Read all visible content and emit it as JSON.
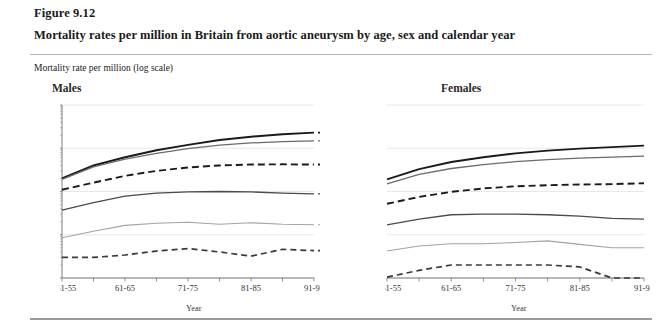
{
  "figure": {
    "label": "Figure 9.12",
    "title": "Mortality rates per million in Britain from aortic aneurysm by age, sex and calendar year",
    "axis_caption": "Mortality rate per million (log scale)"
  },
  "chart_data": {
    "type": "line",
    "title": "Mortality rates per million in Britain from aortic aneurysm by age, sex and calendar year",
    "subtitle": "Mortality rate per million (log scale)",
    "xlabel": "Year",
    "ylabel": "Mortality rate per million (log scale)",
    "yscale": "log",
    "ylim": [
      1,
      10000
    ],
    "ytick_labels": [
      "1",
      "10",
      "100",
      "1,000",
      "10,000"
    ],
    "ytick_values": [
      1,
      10,
      100,
      1000,
      10000
    ],
    "grid": true,
    "legend_position": "right-of-males-panel",
    "categories": [
      "1951-55",
      "56-60",
      "61-65",
      "66-70",
      "71-75",
      "76-80",
      "81-85",
      "86-90",
      "91-92"
    ],
    "xtick_labels": [
      "1951-55",
      "61-65",
      "71-75",
      "81-85",
      "91-92"
    ],
    "panels": [
      {
        "name": "Males",
        "series": [
          {
            "name": "80-84",
            "style": "solid-thick",
            "color": "#1a1a1a",
            "values": [
              200,
              400,
              620,
              900,
              1200,
              1550,
              1850,
              2100,
              2300
            ]
          },
          {
            "name": "70-79",
            "style": "solid-medium",
            "color": "#6b6b6b",
            "values": [
              190,
              370,
              560,
              760,
              980,
              1180,
              1330,
              1420,
              1480
            ]
          },
          {
            "name": "60-69",
            "style": "dashed-thick",
            "color": "#1a1a1a",
            "values": [
              110,
              160,
              230,
              300,
              360,
              400,
              420,
              425,
              420
            ]
          },
          {
            "name": "50-59",
            "style": "solid-medium",
            "color": "#4a4a4a",
            "values": [
              37,
              55,
              78,
              92,
              98,
              100,
              98,
              92,
              88
            ]
          },
          {
            "name": "40-49",
            "style": "solid-thin",
            "color": "#a3a3a3",
            "values": [
              8.5,
              12,
              16.5,
              18.5,
              19.5,
              17.5,
              19,
              17.5,
              17
            ]
          },
          {
            "name": "30-39",
            "style": "dashed-medium",
            "color": "#3a3a3a",
            "values": [
              3.0,
              3.0,
              3.4,
              4.2,
              4.8,
              4.0,
              3.2,
              4.6,
              4.3
            ]
          }
        ]
      },
      {
        "name": "Females",
        "series": [
          {
            "name": "80-84",
            "style": "solid-thick",
            "color": "#1a1a1a",
            "values": [
              190,
              330,
              480,
              620,
              760,
              880,
              980,
              1060,
              1150
            ]
          },
          {
            "name": "70-79",
            "style": "solid-medium",
            "color": "#6b6b6b",
            "values": [
              150,
              250,
              340,
              420,
              490,
              545,
              590,
              625,
              660
            ]
          },
          {
            "name": "60-69",
            "style": "dashed-thick",
            "color": "#1a1a1a",
            "values": [
              52,
              75,
              98,
              118,
              132,
              140,
              145,
              148,
              155
            ]
          },
          {
            "name": "50-59",
            "style": "solid-medium",
            "color": "#4a4a4a",
            "values": [
              17,
              23,
              29,
              30,
              30,
              29,
              27,
              24,
              23
            ]
          },
          {
            "name": "40-49",
            "style": "solid-thin",
            "color": "#a3a3a3",
            "values": [
              4.2,
              5.5,
              6.2,
              6.2,
              6.6,
              7.2,
              6.0,
              5.0,
              5.0
            ]
          },
          {
            "name": "30-39",
            "style": "dashed-medium",
            "color": "#3a3a3a",
            "values": [
              1.05,
              1.5,
              2.0,
              2.0,
              2.0,
              2.0,
              1.8,
              1.0,
              1.0,
              1.7
            ]
          }
        ]
      }
    ],
    "legend": [
      "80-84",
      "70-79",
      "60-69",
      "50-59",
      "40-49",
      "30-39"
    ]
  },
  "panels": {
    "males": {
      "title": "Males",
      "xlabel": "Year"
    },
    "females": {
      "title": "Females",
      "xlabel": "Year"
    }
  },
  "colors": {
    "grid": "#e2e2e2",
    "axis": "#7a7a7a",
    "rule": "#b4b4b4",
    "text": "#1a1a1a"
  }
}
